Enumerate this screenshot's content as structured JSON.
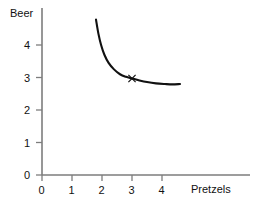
{
  "chart_data": {
    "type": "line",
    "title": "",
    "subtitle": "",
    "xlabel": "Pretzels",
    "ylabel": "Beer",
    "xlim": [
      0,
      5.2
    ],
    "ylim": [
      0,
      5.1
    ],
    "xticks": [
      "0",
      "1",
      "2",
      "3",
      "4"
    ],
    "xtick_values": [
      0,
      1,
      2,
      3,
      4
    ],
    "yticks": [
      "0",
      "1",
      "2",
      "3",
      "4"
    ],
    "ytick_values": [
      0,
      1,
      2,
      3,
      4
    ],
    "grid": false,
    "legend": null,
    "series": [
      {
        "name": "indifference-curve",
        "type": "line",
        "color": "#111111",
        "points": [
          [
            1.8,
            4.78
          ],
          [
            1.88,
            4.35
          ],
          [
            1.97,
            4.0
          ],
          [
            2.08,
            3.7
          ],
          [
            2.22,
            3.45
          ],
          [
            2.4,
            3.25
          ],
          [
            2.6,
            3.1
          ],
          [
            2.8,
            3.02
          ],
          [
            3.0,
            2.97
          ],
          [
            3.25,
            2.91
          ],
          [
            3.5,
            2.86
          ],
          [
            3.8,
            2.82
          ],
          [
            4.1,
            2.8
          ],
          [
            4.35,
            2.79
          ],
          [
            4.6,
            2.8
          ]
        ]
      }
    ],
    "annotations": [
      {
        "name": "bundle-marker",
        "marker": "x",
        "x": 3.0,
        "y": 2.97,
        "label": "",
        "color": "#111111"
      }
    ]
  },
  "axes": {
    "y_title": "Beer",
    "x_title": "Pretzels"
  }
}
